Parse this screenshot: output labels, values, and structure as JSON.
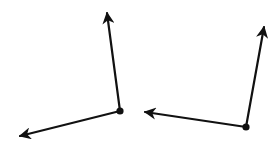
{
  "diagram": {
    "type": "two-angles",
    "stroke_color": "#111111",
    "background": "#ffffff",
    "angles": [
      {
        "name": "angle-left",
        "vertex": [
          120,
          111
        ],
        "rays": [
          {
            "name": "ray-up",
            "tip": [
              107,
              13
            ]
          },
          {
            "name": "ray-down-left",
            "tip": [
              20,
              136
            ]
          }
        ]
      },
      {
        "name": "angle-right",
        "vertex": [
          246,
          127
        ],
        "rays": [
          {
            "name": "ray-up",
            "tip": [
              264,
              27
            ]
          },
          {
            "name": "ray-left",
            "tip": [
              145,
              112
            ]
          }
        ]
      }
    ]
  }
}
